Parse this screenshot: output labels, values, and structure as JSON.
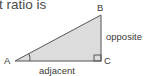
{
  "header": {
    "text_fragment": "t ratio is"
  },
  "diagram": {
    "type": "right-triangle",
    "vertices": {
      "A": "A",
      "B": "B",
      "C": "C"
    },
    "sides": {
      "adjacent": "adjacent",
      "opposite": "opposite"
    },
    "colors": {
      "fill": "#dcdcdc",
      "stroke": "#555555"
    }
  }
}
